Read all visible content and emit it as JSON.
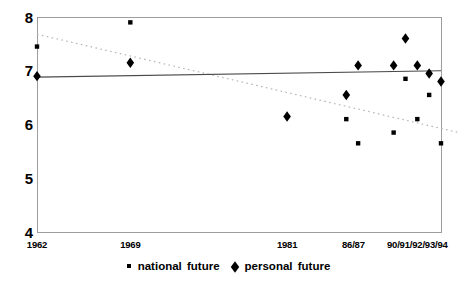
{
  "figure": {
    "background": "#ffffff",
    "border_color": "#9d9d9d",
    "marker_color": "#000000",
    "solid_line_color": "#4a4a4a",
    "dotted_line_color": "#b5b5b5",
    "text_color": "#000000"
  },
  "chart_data": {
    "type": "scatter",
    "title": "",
    "grid": false,
    "legend_position": "bottom-center",
    "x_axis": {
      "min": 1962,
      "max": 1994,
      "anchors": [
        [
          1962,
          0.0
        ],
        [
          1969,
          0.231
        ],
        [
          1981,
          0.619
        ],
        [
          1994,
          1.0
        ]
      ],
      "ticks": [
        {
          "label": "1962",
          "year": 1962
        },
        {
          "label": "1969",
          "year": 1969
        },
        {
          "label": "1981",
          "year": 1981
        },
        {
          "label": "86/87",
          "year": 1986.6
        },
        {
          "label": "90/91/92/93/94",
          "year": 1992
        }
      ]
    },
    "y_axis": {
      "min": 4,
      "max": 8,
      "ticks": [
        {
          "label": "8",
          "value": 8
        },
        {
          "label": "7",
          "value": 7
        },
        {
          "label": "6",
          "value": 6
        },
        {
          "label": "5",
          "value": 5
        },
        {
          "label": "4",
          "value": 4
        }
      ]
    },
    "series": [
      {
        "name": "national future",
        "marker": "square",
        "points": [
          [
            1962,
            7.45
          ],
          [
            1969,
            7.9
          ],
          [
            1986,
            6.1
          ],
          [
            1987,
            5.65
          ],
          [
            1990,
            5.85
          ],
          [
            1991,
            6.85
          ],
          [
            1992,
            6.1
          ],
          [
            1993,
            6.55
          ],
          [
            1994,
            5.65
          ]
        ]
      },
      {
        "name": "personal future",
        "marker": "diamond",
        "points": [
          [
            1962,
            6.9
          ],
          [
            1969,
            7.15
          ],
          [
            1981,
            6.15
          ],
          [
            1986,
            6.55
          ],
          [
            1987,
            7.1
          ],
          [
            1990,
            7.1
          ],
          [
            1991,
            7.6
          ],
          [
            1992,
            7.1
          ],
          [
            1993,
            6.95
          ],
          [
            1994,
            6.8
          ]
        ]
      }
    ],
    "trend_lines": [
      {
        "series": "national future",
        "style": "dotted",
        "points": [
          [
            1962,
            7.68
          ],
          [
            1995.5,
            5.85
          ]
        ]
      },
      {
        "series": "personal future",
        "style": "solid",
        "points": [
          [
            1962,
            6.88
          ],
          [
            1994,
            7.0
          ]
        ]
      }
    ],
    "legend": [
      {
        "label": "national future",
        "marker": "square"
      },
      {
        "label": "personal future",
        "marker": "diamond"
      }
    ]
  }
}
